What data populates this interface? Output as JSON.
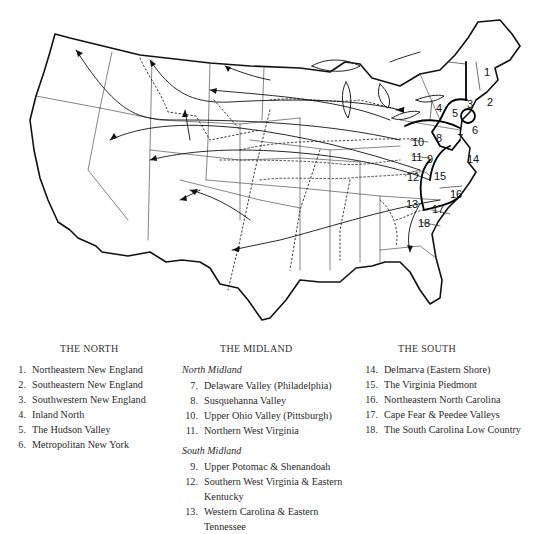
{
  "page_header": {
    "page_number": "",
    "running_title": ""
  },
  "map": {
    "description": "Map of the eastern and western United States showing dialect areas (numbered 1-18) along the Atlantic seaboard, with arrows indicating westward migration and dotted isogloss lines",
    "region_labels": [
      "1",
      "2",
      "3",
      "4",
      "5",
      "6",
      "7",
      "8",
      "9",
      "10",
      "11",
      "12",
      "13",
      "14",
      "15",
      "16",
      "17",
      "18"
    ]
  },
  "legend": {
    "north": {
      "heading": "The North",
      "items": [
        {
          "num": "1.",
          "label": "Northeastern New England"
        },
        {
          "num": "2.",
          "label": "Southeastern New England"
        },
        {
          "num": "3.",
          "label": "Southwestern New England"
        },
        {
          "num": "4.",
          "label": "Inland North"
        },
        {
          "num": "5.",
          "label": "The Hudson Valley"
        },
        {
          "num": "6.",
          "label": "Metropolitan New York"
        }
      ]
    },
    "midland": {
      "heading": "The Midland",
      "north_midland": {
        "subheading": "North Midland",
        "items": [
          {
            "num": "7.",
            "label": "Delaware Valley (Philadelphia)"
          },
          {
            "num": "8.",
            "label": "Susquehanna Valley"
          },
          {
            "num": "10.",
            "label": "Upper Ohio Valley (Pittsburgh)"
          },
          {
            "num": "11.",
            "label": "Northern West Virginia"
          }
        ]
      },
      "south_midland": {
        "subheading": "South Midland",
        "items": [
          {
            "num": "9.",
            "label": "Upper Potomac & Shenandoah"
          },
          {
            "num": "12.",
            "label": "Southern West Virginia & Eastern Kentucky"
          },
          {
            "num": "13.",
            "label": "Western Carolina & Eastern Tennessee"
          }
        ]
      }
    },
    "south": {
      "heading": "The South",
      "items": [
        {
          "num": "14.",
          "label": "Delmarva (Eastern Shore)"
        },
        {
          "num": "15.",
          "label": "The Virginia Piedmont"
        },
        {
          "num": "16.",
          "label": "Northeastern North Carolina"
        },
        {
          "num": "17.",
          "label": "Cape Fear & Peedee Valleys"
        },
        {
          "num": "18.",
          "label": "The South Carolina Low Country"
        }
      ]
    }
  }
}
